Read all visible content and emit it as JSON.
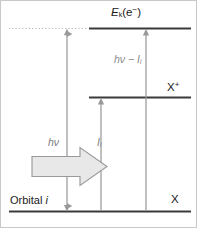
{
  "figure": {
    "kind": "energy-level-diagram",
    "title_visible": false,
    "width": 197,
    "height": 228,
    "background_color": "#ffffff",
    "border_color": "#c8c8c8"
  },
  "levels": [
    {
      "id": "ionized-plus-electron",
      "label_text": "E",
      "label_sub": "k",
      "label_suffix": "(e",
      "label_sup": "−",
      "label_close": ")",
      "line_style": "solid-with-dotted-extension",
      "color": "#3a3a3a"
    },
    {
      "id": "cation",
      "label_text": "X",
      "label_sup": "+",
      "line_style": "solid",
      "color": "#3a3a3a"
    },
    {
      "id": "neutral-ground",
      "label_text": "X",
      "label_sup": "",
      "line_style": "solid",
      "color": "#3a3a3a"
    }
  ],
  "labels": {
    "top_level": {
      "main": "E",
      "sub": "k",
      "paren_open": "(e",
      "charge": "−",
      "paren_close": ")"
    },
    "cation_level": {
      "main": "X",
      "charge": "+"
    },
    "ground_level": {
      "main": "X"
    },
    "orbital": {
      "word": "Orbital",
      "index": "i"
    }
  },
  "arrows": [
    {
      "id": "photon-energy",
      "label_main": "hν",
      "label_sub": "",
      "direction": "double",
      "color": "#9a9a9a",
      "from_level": "neutral-ground",
      "to_level": "ionized-plus-electron"
    },
    {
      "id": "ionization-energy",
      "label_main": "I",
      "label_sub": "i",
      "direction": "up",
      "color": "#9a9a9a",
      "from_level": "neutral-ground",
      "to_level": "cation"
    },
    {
      "id": "kinetic-energy",
      "label_main": "hν − I",
      "label_sub": "i",
      "direction": "up",
      "color": "#9a9a9a",
      "from_level": "neutral-ground",
      "to_level": "ionized-plus-electron"
    }
  ],
  "block_arrow": {
    "id": "incident-photon-block-arrow",
    "direction": "right",
    "fill_color": "#e8e8e8",
    "stroke_color": "#9a9a9a",
    "associated_label": "hν"
  },
  "colors": {
    "level_line": "#3a3a3a",
    "dotted_line": "#b0b0b0",
    "thin_arrow": "#9a9a9a",
    "block_fill": "#e8e8e8",
    "block_stroke": "#9a9a9a",
    "text_dark": "#1a1a1a",
    "text_gray": "#7d7d7d"
  }
}
